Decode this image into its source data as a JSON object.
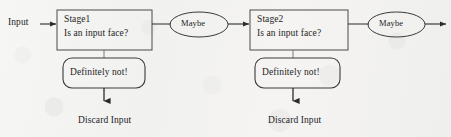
{
  "diagram": {
    "type": "flowchart",
    "orientation": "left-to-right",
    "background_color": "#f3f3f2",
    "stroke_color": "#2b2b2b",
    "text_color": "#242424",
    "entry": {
      "label": "Input",
      "x": 8,
      "y": 16
    },
    "stages": [
      {
        "id": "stage1",
        "box_label_line1": "Stage1",
        "box_label_line2": "Is an input face?",
        "box": {
          "x": 57,
          "y": 10,
          "width": 95,
          "height": 40
        },
        "accept": {
          "label": "Maybe",
          "shape": "ellipse",
          "x": 170,
          "y": 12,
          "width": 58,
          "height": 25
        },
        "reject": {
          "label": "Definitely not!",
          "shape": "rounded-rect",
          "x": 63,
          "y": 58,
          "width": 82,
          "height": 30
        },
        "terminal": {
          "label": "Discard Input",
          "x": 78,
          "y": 114
        }
      },
      {
        "id": "stage2",
        "box_label_line1": "Stage2",
        "box_label_line2": "Is an input face?",
        "box": {
          "x": 250,
          "y": 10,
          "width": 98,
          "height": 40
        },
        "accept": {
          "label": "Maybe",
          "shape": "ellipse",
          "x": 368,
          "y": 12,
          "width": 57,
          "height": 25
        },
        "reject": {
          "label": "Definitely not!",
          "shape": "rounded-rect",
          "x": 255,
          "y": 58,
          "width": 85,
          "height": 30
        },
        "terminal": {
          "label": "Discard Input",
          "x": 268,
          "y": 114
        }
      }
    ],
    "exit_arrow": {
      "from_x": 425,
      "to_x": 446,
      "y": 24
    }
  }
}
